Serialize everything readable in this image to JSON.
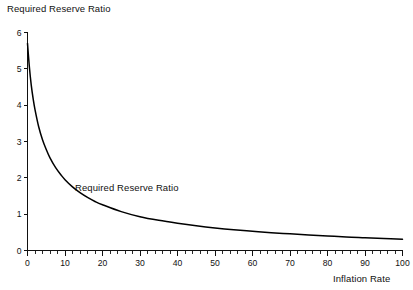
{
  "chart_data": {
    "type": "line",
    "title": "Required Reserve Ratio",
    "xlabel": "Inflation Rate",
    "ylabel": "",
    "xlim": [
      0,
      100
    ],
    "ylim": [
      0,
      6
    ],
    "grid": false,
    "legend": "inline-annotation",
    "annotations": [
      {
        "text": "Required Reserve Ratio",
        "x": 10,
        "y": 1.75
      }
    ],
    "xticks": [
      0,
      10,
      20,
      30,
      40,
      50,
      60,
      70,
      80,
      90,
      100
    ],
    "xtick_labels": [
      "0",
      "10",
      "20",
      "30",
      "40",
      "50",
      "60",
      "70",
      "80",
      "90",
      "100"
    ],
    "xminor_step": 2,
    "yticks": [
      0,
      1,
      2,
      3,
      4,
      5,
      6
    ],
    "ytick_labels": [
      "0",
      "1",
      "2",
      "3",
      "4",
      "5",
      "6"
    ],
    "series": [
      {
        "name": "Required Reserve Ratio",
        "color": "#000000",
        "x": [
          0,
          0.5,
          1,
          1.5,
          2,
          3,
          4,
          5,
          6,
          7.5,
          9,
          10,
          12,
          14,
          16,
          18,
          20,
          25,
          30,
          35,
          40,
          45,
          50,
          55,
          60,
          65,
          70,
          75,
          80,
          85,
          90,
          95,
          100
        ],
        "values": [
          5.7,
          5.05,
          4.55,
          4.18,
          3.88,
          3.4,
          3.05,
          2.78,
          2.55,
          2.28,
          2.07,
          1.95,
          1.75,
          1.59,
          1.46,
          1.35,
          1.26,
          1.07,
          0.93,
          0.83,
          0.75,
          0.68,
          0.62,
          0.57,
          0.53,
          0.49,
          0.46,
          0.43,
          0.4,
          0.37,
          0.35,
          0.33,
          0.31
        ]
      }
    ]
  },
  "figure": {
    "background": "#ffffff",
    "axis_color": "#111111"
  }
}
